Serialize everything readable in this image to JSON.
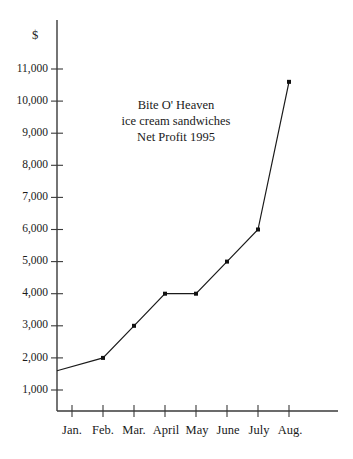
{
  "chart_data": {
    "type": "line",
    "title": "Bite O' Heaven ice cream sandwiches Net Profit 1995",
    "title_lines": [
      "Bite O' Heaven",
      "ice cream sandwiches",
      "Net Profit 1995"
    ],
    "xlabel": "",
    "ylabel": "$",
    "unit_symbol": "$",
    "categories": [
      "Jan.",
      "Feb.",
      "Mar.",
      "April",
      "May",
      "June",
      "July",
      "Aug."
    ],
    "values": [
      1600,
      2000,
      3000,
      4000,
      4000,
      5000,
      6000,
      10600
    ],
    "ytick_labels": [
      "1,000",
      "2,000",
      "3,000",
      "4,000",
      "5,000",
      "6,000",
      "7,000",
      "8,000",
      "9,000",
      "10,000",
      "11,000"
    ],
    "ytick_values": [
      1000,
      2000,
      3000,
      4000,
      5000,
      6000,
      7000,
      8000,
      9000,
      10000,
      11000
    ],
    "ylim": [
      0,
      11600
    ],
    "grid": false,
    "legend": false,
    "markers": true,
    "marker_shape": "square",
    "line_color": "#1a1a1a",
    "axis_color": "#3a3a3a",
    "background_color": "#ffffff",
    "first_point_on_axis": true
  },
  "layout": {
    "axis_x_px": 57,
    "axis_top_px": 20,
    "axis_bottom_px": 411,
    "axis_right_px": 338,
    "tick_start_px": 72,
    "tick_step_px": 31,
    "y_1000_px": 390,
    "y_step_px": 32.1,
    "title_center_x": 175,
    "title_first_line_y": 108,
    "title_line_height": 16,
    "unit_x": 35,
    "unit_y": 39,
    "xtick_label_y": 432
  }
}
